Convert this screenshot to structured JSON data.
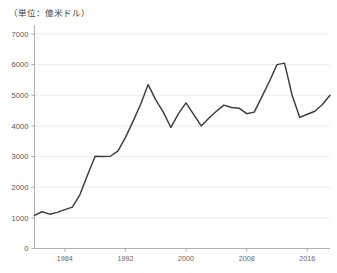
{
  "caption": {
    "unit_note": "（単位：億米ドル）"
  },
  "chart_data": {
    "type": "line",
    "title": "",
    "subtitle": "",
    "xlabel": "",
    "ylabel": "",
    "unit_label": "（単位：億米ドル）",
    "grid": true,
    "legend": "none",
    "xlim": [
      1980,
      2019
    ],
    "ylim": [
      0,
      7000
    ],
    "y_ticks": [
      0,
      1000,
      2000,
      3000,
      4000,
      5000,
      6000,
      7000
    ],
    "y_tick_labels": [
      "0",
      "1000",
      "2000",
      "3000",
      "4000",
      "5000",
      "6000",
      "7000"
    ],
    "x_ticks": [
      1984,
      1992,
      2000,
      2008,
      2016
    ],
    "x_tick_labels": [
      "1984",
      "1992",
      "2000",
      "2008",
      "2016"
    ],
    "line_color": "#3c3c3c",
    "grid_color": "#e9e9e9",
    "axis_color": "#9a9a9a",
    "background_color": "#ffffff",
    "series": [
      {
        "name": "value",
        "x": [
          1980,
          1981,
          1982,
          1983,
          1984,
          1985,
          1986,
          1987,
          1988,
          1989,
          1990,
          1991,
          1992,
          1993,
          1994,
          1995,
          1996,
          1997,
          1998,
          1999,
          2000,
          2001,
          2002,
          2003,
          2004,
          2005,
          2006,
          2007,
          2008,
          2009,
          2010,
          2011,
          2012,
          2013,
          2014,
          2015,
          2016,
          2017,
          2018,
          2019
        ],
        "values": [
          1080,
          1200,
          1120,
          1180,
          1270,
          1350,
          1760,
          2400,
          3010,
          3000,
          3010,
          3180,
          3620,
          4150,
          4700,
          5350,
          4850,
          4450,
          3950,
          4400,
          4750,
          4380,
          4000,
          4250,
          4480,
          4680,
          4600,
          4580,
          4400,
          4450,
          4950,
          5450,
          6000,
          6050,
          5000,
          4280,
          4380,
          4480,
          4700,
          5000
        ]
      }
    ]
  }
}
